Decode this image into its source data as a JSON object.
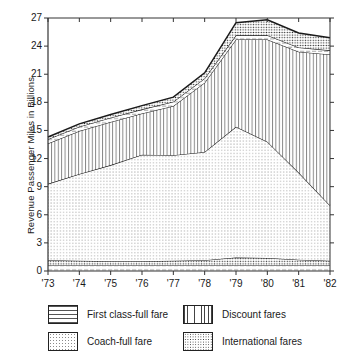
{
  "chart_data": {
    "type": "area",
    "stacked": true,
    "title": "",
    "xlabel": "",
    "ylabel": "Revenue Passenger Miles in Billions",
    "categories": [
      "'73",
      "'74",
      "'75",
      "'76",
      "'77",
      "'78",
      "'79",
      "'80",
      "'81",
      "'82"
    ],
    "x": [
      1973,
      1974,
      1975,
      1976,
      1977,
      1978,
      1979,
      1980,
      1981,
      1982
    ],
    "ylim": [
      0,
      27
    ],
    "yticks": [
      0,
      3,
      6,
      9,
      12,
      15,
      18,
      21,
      24,
      27
    ],
    "grid": false,
    "legend_position": "below-plot",
    "series": [
      {
        "name": "First class-full fare",
        "pattern": "horizontal-dashes",
        "values": [
          0.6,
          0.6,
          0.6,
          0.6,
          0.6,
          0.6,
          0.6,
          0.6,
          0.6,
          0.6
        ]
      },
      {
        "name": "International fares",
        "pattern": "dense-dots",
        "values": [
          0.55,
          0.5,
          0.45,
          0.45,
          0.5,
          0.55,
          0.85,
          0.8,
          0.6,
          0.5
        ]
      },
      {
        "name": "Coach-full fare",
        "pattern": "light-dots",
        "values": [
          8.15,
          9.25,
          10.25,
          11.35,
          11.25,
          11.55,
          13.95,
          12.4,
          9.3,
          5.9
        ]
      },
      {
        "name": "Discount fares",
        "pattern": "vertical-lines",
        "values": [
          4.3,
          4.6,
          4.6,
          4.4,
          5.25,
          7.4,
          9.3,
          10.9,
          12.9,
          16.1
        ]
      },
      {
        "name": "First class-full fare (upper)",
        "pattern": "horizontal-dashes-thin",
        "values": [
          0.45,
          0.45,
          0.45,
          0.45,
          0.45,
          0.45,
          0.45,
          0.45,
          0.45,
          0.45
        ]
      },
      {
        "name": "International fares (upper)",
        "pattern": "dense-dots-upper",
        "values": [
          0.25,
          0.3,
          0.35,
          0.4,
          0.5,
          0.6,
          1.35,
          1.65,
          1.55,
          1.35
        ]
      }
    ],
    "totals": [
      14.3,
      15.7,
      16.7,
      17.65,
      18.55,
      21.15,
      26.5,
      26.8,
      25.4,
      24.9
    ]
  },
  "axes": {
    "y_title": "Revenue Passenger Miles in Billions",
    "y_ticks": [
      "27",
      "24",
      "21",
      "18",
      "15",
      "12",
      "9",
      "6",
      "3",
      "0"
    ],
    "x_ticks": [
      "'73",
      "'74",
      "'75",
      "'76",
      "'77",
      "'78",
      "'79",
      "'80",
      "'81",
      "'82"
    ]
  },
  "legend": {
    "items": [
      {
        "label": "First class-full fare",
        "swatch": "first-class-swatch"
      },
      {
        "label": "Discount fares",
        "swatch": "discount-swatch"
      },
      {
        "label": "Coach-full fare",
        "swatch": "coach-swatch"
      },
      {
        "label": "International fares",
        "swatch": "international-swatch"
      }
    ]
  },
  "colors": {
    "line": "#1a1a1a",
    "axis": "#333333",
    "background": "#ffffff",
    "coach_fill": "#efefef",
    "discount_fill": "#fbfbfb",
    "international_fill": "#e8e8e8",
    "firstclass_fill": "#fdfdfd"
  }
}
